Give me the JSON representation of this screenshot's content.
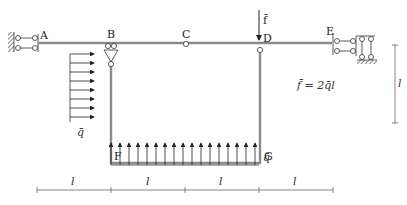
{
  "diagram": {
    "nodes": {
      "A": "A",
      "B": "B",
      "C": "C",
      "D": "D",
      "E": "E",
      "F": "F",
      "G": "G"
    },
    "loads": {
      "force_label": "f̄",
      "force_relation": "f̄ = 2q̄l",
      "distributed_left_label": "q̄",
      "distributed_bottom_label": "q̄"
    },
    "dimensions": {
      "horizontal": [
        "l",
        "l",
        "l",
        "l"
      ],
      "vertical": "l"
    },
    "colors": {
      "beam": "#8a8a8a",
      "lines": "#333333"
    }
  }
}
